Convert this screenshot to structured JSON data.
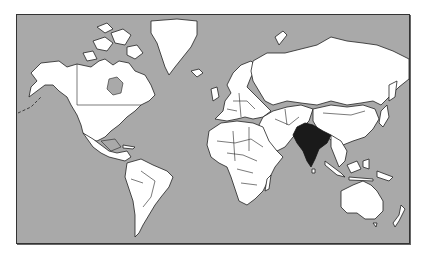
{
  "map": {
    "title": "World map with India highlighted",
    "projection": "mercator",
    "highlighted_country": "India",
    "colors": {
      "ocean": "#a9a9a9",
      "land": "#ffffff",
      "highlight": "#1a1a1a",
      "border": "#222222"
    },
    "regions": [
      {
        "name": "North America",
        "highlighted": false
      },
      {
        "name": "Greenland",
        "highlighted": false
      },
      {
        "name": "South America",
        "highlighted": false
      },
      {
        "name": "Europe",
        "highlighted": false
      },
      {
        "name": "Africa",
        "highlighted": false
      },
      {
        "name": "Russia / Northern Asia",
        "highlighted": false
      },
      {
        "name": "Middle East",
        "highlighted": false
      },
      {
        "name": "India",
        "highlighted": true
      },
      {
        "name": "China / East Asia",
        "highlighted": false
      },
      {
        "name": "Southeast Asia",
        "highlighted": false
      },
      {
        "name": "Australia",
        "highlighted": false
      },
      {
        "name": "New Zealand",
        "highlighted": false
      },
      {
        "name": "Madagascar",
        "highlighted": false
      },
      {
        "name": "Japan",
        "highlighted": false
      }
    ]
  }
}
